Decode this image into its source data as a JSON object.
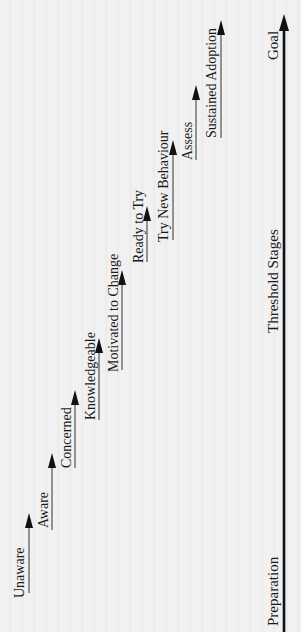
{
  "diagram": {
    "orientation": "rotated -90deg (reads bottom-to-top)",
    "axis": {
      "start_label": "Preparation",
      "middle_label": "Threshold Stages",
      "end_label": "Goal"
    },
    "stages": [
      {
        "label": "Unaware"
      },
      {
        "label": "Aware"
      },
      {
        "label": "Concerned"
      },
      {
        "label": "Knowledgeable"
      },
      {
        "label": "Motivated to Change"
      },
      {
        "label": "Ready to Try"
      },
      {
        "label": "Try New Behaviour"
      },
      {
        "label": "Assess"
      },
      {
        "label": "Sustained Adoption"
      }
    ],
    "colors": {
      "background": "#f1f1f1",
      "ink": "#111111"
    }
  }
}
